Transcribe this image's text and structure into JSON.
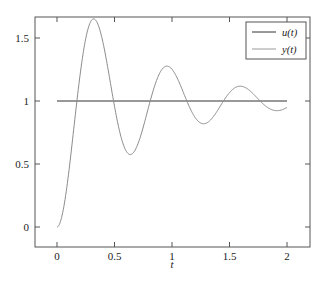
{
  "chart_data": {
    "type": "line",
    "title": "",
    "xlabel": "t",
    "ylabel": "",
    "xlim": [
      -0.2,
      2.2
    ],
    "ylim": [
      -0.16,
      1.66
    ],
    "xticks": [
      0,
      0.5,
      1,
      1.5,
      2
    ],
    "xtick_labels": [
      "0",
      "0.5",
      "1",
      "1.5",
      "2"
    ],
    "yticks": [
      0,
      0.5,
      1,
      1.5
    ],
    "ytick_labels": [
      "0",
      "0.5",
      "1",
      "1.5"
    ],
    "grid": false,
    "legend_position": "upper right",
    "series": [
      {
        "name": "u(t)",
        "color": "#333333",
        "x": [
          0,
          2
        ],
        "y": [
          1,
          1
        ]
      },
      {
        "name": "y(t)",
        "color": "#8c8c8c",
        "x": [
          0,
          0.1,
          0.2,
          0.33,
          0.45,
          0.55,
          0.65,
          0.75,
          0.85,
          0.97,
          1.1,
          1.2,
          1.29,
          1.4,
          1.5,
          1.62,
          1.75,
          1.85,
          1.95,
          2.0
        ],
        "y": [
          0,
          0.42,
          1.05,
          1.53,
          1.32,
          0.93,
          0.73,
          0.86,
          1.05,
          1.15,
          1.06,
          0.96,
          0.92,
          0.95,
          1.01,
          1.03,
          1.0,
          0.975,
          0.98,
          0.98
        ]
      }
    ],
    "model": {
      "wn": 9.95,
      "zeta": 0.135
    }
  },
  "legend": {
    "items": [
      {
        "label": "u(t)",
        "color": "#333333"
      },
      {
        "label": "y(t)",
        "color": "#9a9a9a"
      }
    ]
  },
  "axes": {
    "xlabel": "t",
    "frame_color": "#555555"
  }
}
